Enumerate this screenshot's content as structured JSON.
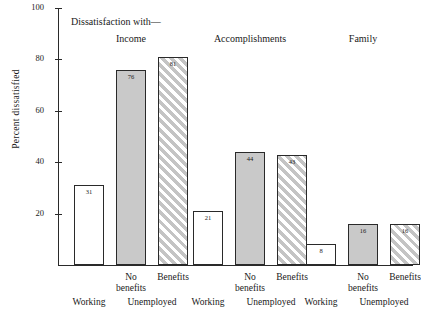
{
  "chart_data": {
    "type": "bar",
    "title": "Dissatisfaction with—",
    "xlabel": "",
    "ylabel": "Percent dissatisfied",
    "ylim": [
      0,
      100
    ],
    "yticks": [
      20,
      40,
      60,
      80,
      100
    ],
    "grid": false,
    "legend": "none",
    "categories": [
      "Income",
      "Accomplishments",
      "Family"
    ],
    "subcategories": [
      "Working",
      "Unemployed / No benefits",
      "Unemployed / Benefits"
    ],
    "series": [
      {
        "name": "Working",
        "values": [
          31,
          21,
          8
        ]
      },
      {
        "name": "No benefits",
        "values": [
          76,
          44,
          16
        ]
      },
      {
        "name": "Benefits",
        "values": [
          81,
          43,
          16
        ]
      }
    ],
    "bars": [
      {
        "group": "Income",
        "sub": "Working",
        "value": 31,
        "fill": "none"
      },
      {
        "group": "Income",
        "sub": "No benefits",
        "value": 76,
        "fill": "gray"
      },
      {
        "group": "Income",
        "sub": "Benefits",
        "value": 81,
        "fill": "hatch"
      },
      {
        "group": "Accomplishments",
        "sub": "Working",
        "value": 21,
        "fill": "none"
      },
      {
        "group": "Accomplishments",
        "sub": "No benefits",
        "value": 44,
        "fill": "gray"
      },
      {
        "group": "Accomplishments",
        "sub": "Benefits",
        "value": 43,
        "fill": "hatch"
      },
      {
        "group": "Family",
        "sub": "Working",
        "value": 8,
        "fill": "none"
      },
      {
        "group": "Family",
        "sub": "No benefits",
        "value": 16,
        "fill": "gray"
      },
      {
        "group": "Family",
        "sub": "Benefits",
        "value": 16,
        "fill": "hatch"
      }
    ]
  },
  "axis": {
    "y_title": "Percent  dissatisfied",
    "y_tick_labels": [
      "100",
      "80",
      "60",
      "40",
      "20"
    ],
    "x_tier1_labels": [
      "No\nbenefits",
      "Benefits",
      "No\nbenefits",
      "Benefits",
      "No\nbenefits",
      "Benefits"
    ],
    "x_tier2_labels": [
      "Working",
      "Unemployed",
      "Working",
      "Unemployed",
      "Working",
      "Unemployed"
    ]
  },
  "header": {
    "caption": "Dissatisfaction with—",
    "groups": [
      "Income",
      "Accomplishments",
      "Family"
    ]
  },
  "bar_value_labels": [
    "31",
    "76",
    "81",
    "21",
    "44",
    "43",
    "8",
    "16",
    "16"
  ],
  "colors": {
    "axis": "#2a2a2a",
    "text": "#1a1a1a",
    "bar_none": "#ffffff",
    "bar_gray": "#c9c9c9",
    "bar_hatch": "#c4c4c4",
    "background": "#ffffff"
  }
}
